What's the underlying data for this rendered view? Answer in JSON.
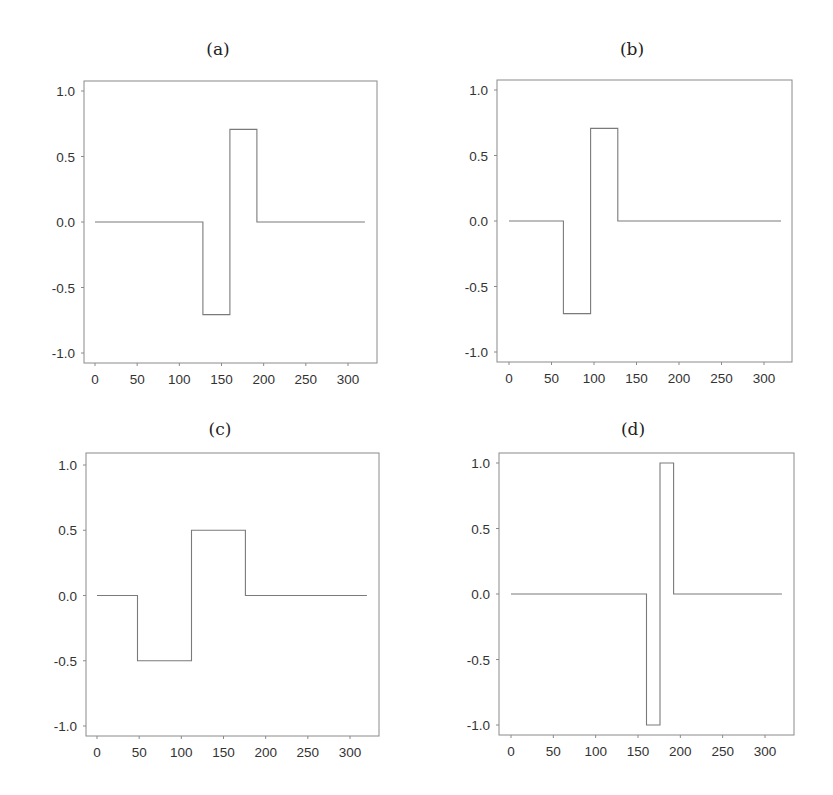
{
  "figure": {
    "panels": [
      {
        "id": "a",
        "title": "(a)"
      },
      {
        "id": "b",
        "title": "(b)"
      },
      {
        "id": "c",
        "title": "(c)"
      },
      {
        "id": "d",
        "title": "(d)"
      }
    ]
  },
  "chart_data": [
    {
      "type": "line",
      "title": "(a)",
      "xlabel": "",
      "ylabel": "",
      "xlim": [
        -10,
        330
      ],
      "ylim": [
        -1.08,
        1.08
      ],
      "xticks": [
        0,
        50,
        100,
        150,
        200,
        250,
        300
      ],
      "yticks": [
        -1.0,
        -0.5,
        0.0,
        0.5,
        1.0
      ],
      "xtick_labels": [
        "0",
        "50",
        "100",
        "150",
        "200",
        "250",
        "300"
      ],
      "ytick_labels": [
        "-1.0",
        "-0.5",
        "0.0",
        "0.5",
        "1.0"
      ],
      "grid": false,
      "series": [
        {
          "name": "wavelet",
          "step": true,
          "x": [
            0,
            128,
            128,
            160,
            160,
            192,
            192,
            320
          ],
          "y": [
            0,
            0,
            -0.707,
            -0.707,
            0.707,
            0.707,
            0,
            0
          ]
        }
      ]
    },
    {
      "type": "line",
      "title": "(b)",
      "xlabel": "",
      "ylabel": "",
      "xlim": [
        -10,
        330
      ],
      "ylim": [
        -1.08,
        1.08
      ],
      "xticks": [
        0,
        50,
        100,
        150,
        200,
        250,
        300
      ],
      "yticks": [
        -1.0,
        -0.5,
        0.0,
        0.5,
        1.0
      ],
      "xtick_labels": [
        "0",
        "50",
        "100",
        "150",
        "200",
        "250",
        "300"
      ],
      "ytick_labels": [
        "-1.0",
        "-0.5",
        "0.0",
        "0.5",
        "1.0"
      ],
      "grid": false,
      "series": [
        {
          "name": "wavelet",
          "step": true,
          "x": [
            0,
            64,
            64,
            96,
            96,
            128,
            128,
            320
          ],
          "y": [
            0,
            0,
            -0.707,
            -0.707,
            0.707,
            0.707,
            0,
            0
          ]
        }
      ]
    },
    {
      "type": "line",
      "title": "(c)",
      "xlabel": "",
      "ylabel": "",
      "xlim": [
        -10,
        330
      ],
      "ylim": [
        -1.08,
        1.08
      ],
      "xticks": [
        0,
        50,
        100,
        150,
        200,
        250,
        300
      ],
      "yticks": [
        -1.0,
        -0.5,
        0.0,
        0.5,
        1.0
      ],
      "xtick_labels": [
        "0",
        "50",
        "100",
        "150",
        "200",
        "250",
        "300"
      ],
      "ytick_labels": [
        "-1.0",
        "-0.5",
        "0.0",
        "0.5",
        "1.0"
      ],
      "grid": false,
      "series": [
        {
          "name": "wavelet",
          "step": true,
          "x": [
            0,
            48,
            48,
            112,
            112,
            176,
            176,
            320
          ],
          "y": [
            0,
            0,
            -0.5,
            -0.5,
            0.5,
            0.5,
            0,
            0
          ]
        }
      ]
    },
    {
      "type": "line",
      "title": "(d)",
      "xlabel": "",
      "ylabel": "",
      "xlim": [
        -10,
        330
      ],
      "ylim": [
        -1.08,
        1.08
      ],
      "xticks": [
        0,
        50,
        100,
        150,
        200,
        250,
        300
      ],
      "yticks": [
        -1.0,
        -0.5,
        0.0,
        0.5,
        1.0
      ],
      "xtick_labels": [
        "0",
        "50",
        "100",
        "150",
        "200",
        "250",
        "300"
      ],
      "ytick_labels": [
        "-1.0",
        "-0.5",
        "0.0",
        "0.5",
        "1.0"
      ],
      "grid": false,
      "series": [
        {
          "name": "wavelet",
          "step": true,
          "x": [
            0,
            160,
            160,
            176,
            176,
            192,
            192,
            320
          ],
          "y": [
            0,
            0,
            -1.0,
            -1.0,
            1.0,
            1.0,
            0,
            0
          ]
        }
      ]
    }
  ]
}
